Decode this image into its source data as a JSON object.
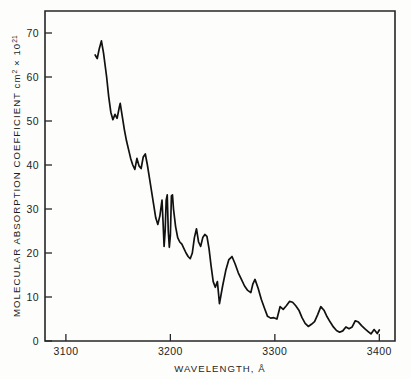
{
  "chart_data": {
    "type": "line",
    "title": "",
    "xlabel": "WAVELENGTH, Å",
    "ylabel": "MOLECULAR ABSORPTION COEFFICIENT  cm² × 10²¹",
    "ylabel_main": "MOLECULAR ABSORPTION COEFFICIENT  cm",
    "ylabel_sup1": "2",
    "ylabel_mid": " × 10",
    "ylabel_sup2": "21",
    "xlabel_main": "WAVELENGTH, Å",
    "xlim": [
      3080,
      3415
    ],
    "ylim": [
      0,
      75
    ],
    "xticks": [
      3100,
      3200,
      3300,
      3400
    ],
    "xticklabels": [
      "3100",
      "3200",
      "3300",
      "3400"
    ],
    "yticks": [
      0,
      10,
      20,
      30,
      40,
      50,
      60,
      70
    ],
    "yticklabels": [
      "0",
      "10",
      "20",
      "30",
      "40",
      "50",
      "60",
      "70"
    ],
    "grid": false,
    "legend": false,
    "legend_position": "none",
    "line_color": "#111111",
    "series": [
      {
        "name": "absorption spectrum",
        "x": [
          3128,
          3130,
          3132,
          3134,
          3136,
          3139,
          3141,
          3143,
          3145,
          3147,
          3149,
          3151,
          3152,
          3154,
          3156,
          3158,
          3160,
          3162,
          3164,
          3166,
          3168,
          3170,
          3172,
          3174,
          3176,
          3178,
          3180,
          3182,
          3184,
          3186,
          3188,
          3190,
          3192,
          3193,
          3194,
          3195,
          3196,
          3197,
          3198,
          3199,
          3200,
          3201,
          3202,
          3203,
          3205,
          3207,
          3209,
          3211,
          3213,
          3215,
          3217,
          3219,
          3221,
          3223,
          3225,
          3227,
          3229,
          3231,
          3233,
          3235,
          3237,
          3239,
          3241,
          3243,
          3245,
          3247,
          3250,
          3253,
          3256,
          3259,
          3262,
          3265,
          3268,
          3271,
          3274,
          3277,
          3279,
          3281,
          3284,
          3287,
          3290,
          3293,
          3296,
          3299,
          3302,
          3305,
          3308,
          3311,
          3314,
          3317,
          3320,
          3323,
          3326,
          3329,
          3332,
          3335,
          3338,
          3341,
          3344,
          3347,
          3350,
          3353,
          3356,
          3359,
          3362,
          3365,
          3368,
          3371,
          3374,
          3377,
          3380,
          3383,
          3386,
          3389,
          3392,
          3395,
          3398,
          3400
        ],
        "y": [
          65.0,
          64.2,
          66.5,
          68.2,
          65.5,
          60.0,
          55.5,
          52.0,
          50.3,
          51.5,
          50.6,
          53.0,
          54.0,
          51.0,
          48.0,
          45.5,
          43.5,
          41.5,
          40.0,
          39.0,
          41.5,
          39.8,
          39.2,
          41.8,
          42.5,
          40.0,
          37.0,
          34.0,
          31.0,
          28.0,
          26.5,
          28.5,
          32.0,
          27.0,
          21.5,
          25.0,
          32.0,
          33.2,
          25.0,
          21.3,
          24.0,
          33.0,
          33.2,
          30.0,
          26.0,
          23.5,
          22.5,
          22.0,
          21.0,
          20.0,
          19.2,
          18.7,
          20.0,
          23.5,
          25.5,
          22.5,
          21.5,
          23.5,
          24.2,
          23.8,
          21.0,
          17.0,
          13.5,
          12.2,
          13.5,
          8.5,
          12.5,
          16.0,
          18.5,
          19.2,
          17.5,
          15.5,
          14.0,
          12.5,
          11.5,
          11.0,
          13.0,
          14.0,
          12.0,
          9.5,
          7.5,
          5.6,
          5.2,
          5.3,
          5.0,
          7.8,
          7.2,
          8.0,
          9.0,
          8.8,
          8.0,
          7.0,
          5.3,
          4.0,
          3.3,
          3.8,
          4.4,
          6.0,
          7.8,
          7.0,
          5.5,
          4.3,
          3.2,
          2.4,
          2.0,
          2.3,
          3.2,
          2.8,
          3.2,
          4.6,
          4.3,
          3.5,
          2.8,
          2.2,
          1.6,
          2.6,
          1.7,
          2.5
        ]
      }
    ]
  }
}
